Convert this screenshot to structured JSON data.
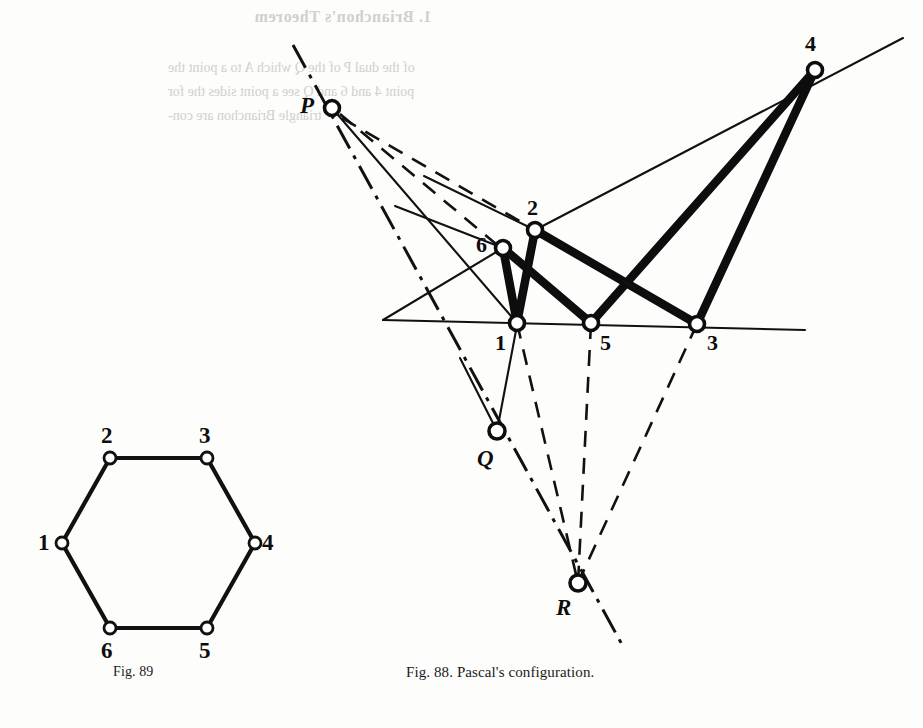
{
  "page": {
    "background": "#fdfdfb",
    "ink": "#0d0d0d",
    "width": 923,
    "height": 728
  },
  "bleed_through": {
    "heading": "1. Brianchon's Theorem",
    "line1": "of the dual  P  of the  Q  which  A  to  a  point  the",
    "line2": "point  4  and  6  and  Q  see  a  point  sides  the  for",
    "line3": "triangle  Brianchon  are  con-"
  },
  "figures": [
    {
      "id": "fig-89",
      "caption": "Fig. 89",
      "caption_x": 113,
      "caption_y": 664,
      "type": "hexagon",
      "vertices": [
        {
          "name": "1",
          "x": 62,
          "y": 543,
          "label_x": 38,
          "label_y": 531
        },
        {
          "name": "2",
          "x": 110,
          "y": 458,
          "label_x": 101,
          "label_y": 424
        },
        {
          "name": "3",
          "x": 207,
          "y": 458,
          "label_x": 199,
          "label_y": 424
        },
        {
          "name": "4",
          "x": 255,
          "y": 543,
          "label_x": 262,
          "label_y": 531
        },
        {
          "name": "5",
          "x": 207,
          "y": 628,
          "label_x": 199,
          "label_y": 639
        },
        {
          "name": "6",
          "x": 110,
          "y": 628,
          "label_x": 101,
          "label_y": 639
        }
      ],
      "edges": [
        [
          "1",
          "2"
        ],
        [
          "2",
          "3"
        ],
        [
          "3",
          "4"
        ],
        [
          "4",
          "5"
        ],
        [
          "5",
          "6"
        ],
        [
          "6",
          "1"
        ]
      ]
    },
    {
      "id": "fig-88",
      "caption": "Fig. 88. Pascal's configuration.",
      "caption_x": 406,
      "caption_y": 664,
      "type": "pascal-configuration",
      "points": [
        {
          "name": "1",
          "x": 517,
          "y": 323,
          "label": "1",
          "label_x": 495,
          "label_y": 332,
          "style": "plain"
        },
        {
          "name": "2",
          "x": 535,
          "y": 230,
          "label": "2",
          "label_x": 527,
          "label_y": 197,
          "style": "plain"
        },
        {
          "name": "3",
          "x": 697,
          "y": 324,
          "label": "3",
          "label_x": 707,
          "label_y": 332,
          "style": "plain"
        },
        {
          "name": "4",
          "x": 815,
          "y": 70,
          "label": "4",
          "label_x": 805,
          "label_y": 33,
          "style": "plain"
        },
        {
          "name": "5",
          "x": 591,
          "y": 323,
          "label": "5",
          "label_x": 600,
          "label_y": 332,
          "style": "plain"
        },
        {
          "name": "6",
          "x": 503,
          "y": 248,
          "label": "6",
          "label_x": 476,
          "label_y": 234,
          "style": "plain"
        },
        {
          "name": "P",
          "x": 332,
          "y": 108,
          "label": "P",
          "label_x": 300,
          "label_y": 94,
          "style": "italic"
        },
        {
          "name": "Q",
          "x": 497,
          "y": 431,
          "label": "Q",
          "label_x": 477,
          "label_y": 447,
          "style": "italic"
        },
        {
          "name": "R",
          "x": 578,
          "y": 583,
          "label": "R",
          "label_x": 556,
          "label_y": 596,
          "style": "italic"
        }
      ],
      "hexagon_sides_thick": [
        [
          "1",
          "2"
        ],
        [
          "2",
          "3"
        ],
        [
          "3",
          "4"
        ],
        [
          "4",
          "5"
        ],
        [
          "5",
          "6"
        ],
        [
          "6",
          "1"
        ]
      ],
      "pascal_line": {
        "through": [
          "P",
          "Q",
          "R"
        ],
        "style": "dash-dot"
      },
      "intersection_points": [
        "P",
        "Q",
        "R"
      ],
      "baseline": {
        "from_x": 383,
        "from_y": 320,
        "to_x": 805,
        "to_y": 330,
        "style": "thin"
      }
    }
  ]
}
